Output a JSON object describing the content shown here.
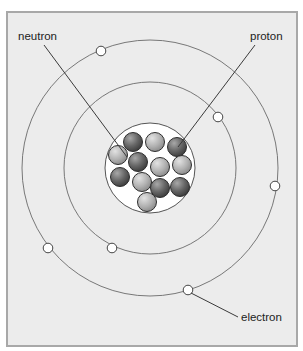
{
  "diagram": {
    "type": "atom-structure",
    "frame": {
      "x": 7,
      "y": 12,
      "width": 290,
      "height": 334,
      "background": "#ececec",
      "border": "#a8a8a8"
    },
    "center": {
      "x": 150,
      "y": 168
    },
    "orbits": [
      {
        "name": "inner-orbit",
        "r": 86
      },
      {
        "name": "outer-orbit",
        "r": 128
      }
    ],
    "nucleus": {
      "r": 45,
      "fill": "#ffffff",
      "particles": [
        {
          "kind": "proton",
          "x": 133,
          "y": 142
        },
        {
          "kind": "neutron",
          "x": 155,
          "y": 142
        },
        {
          "kind": "proton",
          "x": 177,
          "y": 147
        },
        {
          "kind": "neutron",
          "x": 118,
          "y": 155
        },
        {
          "kind": "proton",
          "x": 138,
          "y": 162
        },
        {
          "kind": "neutron",
          "x": 160,
          "y": 167
        },
        {
          "kind": "neutron",
          "x": 182,
          "y": 165
        },
        {
          "kind": "proton",
          "x": 120,
          "y": 177
        },
        {
          "kind": "neutron",
          "x": 142,
          "y": 182
        },
        {
          "kind": "proton",
          "x": 160,
          "y": 188
        },
        {
          "kind": "proton",
          "x": 180,
          "y": 187
        },
        {
          "kind": "neutron",
          "x": 147,
          "y": 202
        }
      ],
      "particle_r": 9.5
    },
    "electrons": [
      {
        "orbit": "outer",
        "x": 101,
        "y": 51
      },
      {
        "orbit": "outer",
        "x": 275,
        "y": 186
      },
      {
        "orbit": "outer",
        "x": 48,
        "y": 248
      },
      {
        "orbit": "outer",
        "x": 188,
        "y": 290
      },
      {
        "orbit": "inner",
        "x": 218,
        "y": 117
      },
      {
        "orbit": "inner",
        "x": 112,
        "y": 248
      }
    ],
    "labels": {
      "neutron": "neutron",
      "proton": "proton",
      "electron": "electron"
    },
    "leaders": {
      "neutron": {
        "x1": 44,
        "y1": 45,
        "x2": 127,
        "y2": 157
      },
      "proton": {
        "x1": 255,
        "y1": 45,
        "x2": 178,
        "y2": 147
      },
      "electron": {
        "x1": 191,
        "y1": 293,
        "x2": 238,
        "y2": 317
      }
    },
    "colors": {
      "proton_dark": "#5a5a5a",
      "neutron_light": "#b4b4b4",
      "line": "#555555",
      "electron_fill": "#ffffff"
    }
  }
}
